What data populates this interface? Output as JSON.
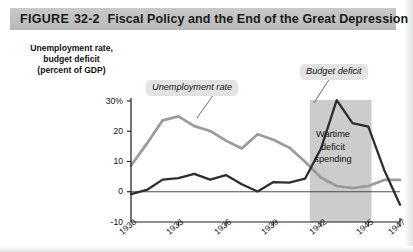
{
  "figure": {
    "label": "FIGURE",
    "number": "32-2",
    "title": "Fiscal Policy and the End of the Great Depression"
  },
  "axis_title": {
    "line1": "Unemployment rate,",
    "line2": "budget deficit",
    "line3": "(percent of GDP)"
  },
  "callouts": {
    "unemployment": "Unemployment rate",
    "deficit": "Budget deficit",
    "band_line1": "Wartime",
    "band_line2": "deficit",
    "band_line3": "spending"
  },
  "colors": {
    "unemployment_line": "#9a9a9a",
    "deficit_line": "#2e2e2e",
    "band_fill": "#cccccc",
    "title_band": "#c2c2c2",
    "callout_bg": "#e3e3e3",
    "axis": "#1a1a1a",
    "page": "#ffffff"
  },
  "chart_data": {
    "type": "line",
    "title": "Fiscal Policy and the End of the Great Depression",
    "xlabel": "",
    "ylabel": "Unemployment rate, budget deficit (percent of GDP)",
    "xlim": [
      1930,
      1947
    ],
    "ylim": [
      -10,
      30
    ],
    "yticks": [
      -10,
      0,
      10,
      20,
      30
    ],
    "ytick_labels": [
      "-10",
      "0",
      "10",
      "20",
      "30%"
    ],
    "xticks": [
      1930,
      1933,
      1936,
      1939,
      1942,
      1945,
      1947
    ],
    "xtick_labels": [
      "1930",
      "1933",
      "1936",
      "1939",
      "1942",
      "1945",
      "1947"
    ],
    "grid": false,
    "legend": "inline-callouts",
    "shaded_regions": [
      {
        "label": "Wartime deficit spending",
        "x_start": 1941.3,
        "x_end": 1945.2,
        "color": "#cccccc"
      }
    ],
    "x": [
      1930,
      1931,
      1932,
      1933,
      1934,
      1935,
      1936,
      1937,
      1938,
      1939,
      1940,
      1941,
      1942,
      1943,
      1944,
      1945,
      1946,
      1947
    ],
    "series": [
      {
        "name": "Unemployment rate",
        "color": "#9a9a9a",
        "values": [
          8.7,
          15.9,
          23.6,
          24.9,
          21.7,
          20.1,
          16.9,
          14.3,
          19.0,
          17.2,
          14.6,
          9.9,
          4.7,
          1.9,
          1.2,
          1.9,
          3.9,
          3.9
        ]
      },
      {
        "name": "Budget deficit",
        "color": "#2e2e2e",
        "values": [
          -0.8,
          0.6,
          4.0,
          4.5,
          5.9,
          4.0,
          5.5,
          2.5,
          0.1,
          3.2,
          3.0,
          4.3,
          14.2,
          30.3,
          22.7,
          21.5,
          7.2,
          -4.3
        ]
      }
    ]
  }
}
